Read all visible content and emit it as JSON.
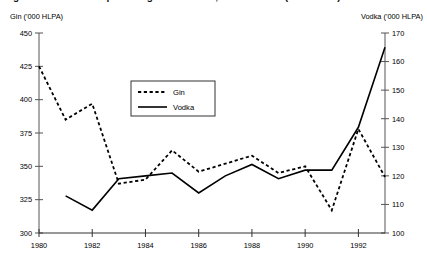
{
  "chart_data": {
    "type": "line",
    "title": "Figure 1: UK consumption of gin and vodka, 1980 to 1993 ('000 HLPA)",
    "title_note": "title is cropped at the top edge of the screenshot",
    "x": [
      1980,
      1981,
      1982,
      1983,
      1984,
      1985,
      1986,
      1987,
      1988,
      1989,
      1990,
      1991,
      1992,
      1993
    ],
    "xlabel": "",
    "xtick_labels": [
      "1980",
      "1982",
      "1984",
      "1986",
      "1988",
      "1990",
      "1992"
    ],
    "xtick_values": [
      1980,
      1982,
      1984,
      1986,
      1988,
      1990,
      1992
    ],
    "xlim": [
      1980,
      1993
    ],
    "grid": false,
    "legend_position": "upper-center-left",
    "axes": [
      {
        "id": "left",
        "label": "Gin ('000 HLPA)",
        "ylim": [
          300,
          450
        ],
        "ytick_values": [
          300,
          325,
          350,
          375,
          400,
          425,
          450
        ],
        "ytick_labels": [
          "300",
          "325",
          "350",
          "375",
          "400",
          "425",
          "450"
        ]
      },
      {
        "id": "right",
        "label": "Vodka ('000 HLPA)",
        "ylim": [
          100,
          170
        ],
        "ytick_values": [
          100,
          110,
          120,
          130,
          140,
          150,
          160,
          170
        ],
        "ytick_labels": [
          "100",
          "110",
          "120",
          "130",
          "140",
          "150",
          "160",
          "170"
        ]
      }
    ],
    "series": [
      {
        "name": "Gin",
        "axis": "left",
        "style": "dashed",
        "color": "#000000",
        "x": [
          1980,
          1981,
          1982,
          1983,
          1984,
          1985,
          1986,
          1987,
          1988,
          1989,
          1990,
          1991,
          1992,
          1993
        ],
        "values": [
          425,
          385,
          397,
          337,
          340,
          362,
          346,
          352,
          358,
          345,
          350,
          317,
          378,
          342
        ]
      },
      {
        "name": "Vodka",
        "axis": "right",
        "style": "solid",
        "color": "#000000",
        "x": [
          1981,
          1982,
          1983,
          1984,
          1985,
          1986,
          1987,
          1988,
          1989,
          1990,
          1991,
          1992,
          1993
        ],
        "values": [
          113,
          108,
          119,
          120,
          121,
          114,
          120,
          124,
          119,
          122,
          122,
          137,
          165
        ]
      }
    ],
    "legend": [
      {
        "label": "Gin",
        "style": "dashed"
      },
      {
        "label": "Vodka",
        "style": "solid"
      }
    ]
  },
  "colors": {
    "axis": "#555555",
    "series": "#000000",
    "background": "#ffffff"
  }
}
